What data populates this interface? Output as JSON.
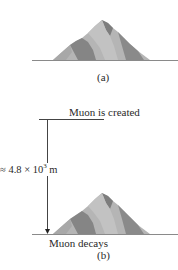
{
  "panel_a": {
    "caption": "(a)"
  },
  "panel_b": {
    "caption": "(b)",
    "top_label": "Muon is created",
    "bottom_label": "Muon decays",
    "distance_label_prefix": "≈ 4.8 × 10",
    "distance_label_exponent": "3",
    "distance_label_unit": " m"
  },
  "colors": {
    "ground_line": "#8a8a8a",
    "mountain_light": "#b9b9b9",
    "mountain_mid": "#a3a3a3",
    "mountain_dark": "#7d7d7d",
    "arrow": "#333333"
  }
}
